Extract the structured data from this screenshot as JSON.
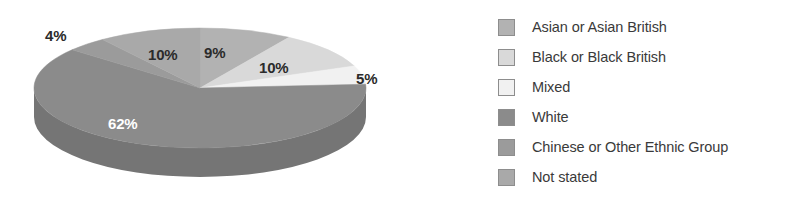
{
  "chart_data": {
    "type": "pie",
    "title": "",
    "subtitle": "",
    "xlabel": "",
    "ylabel": "",
    "three_d": true,
    "legend_position": "right",
    "grid": false,
    "categories": [
      "Asian or Asian British",
      "Black or Black British",
      "Mixed",
      "White",
      "Chinese or Other Ethnic Group",
      "Not stated"
    ],
    "values": [
      9,
      10,
      5,
      62,
      4,
      10
    ],
    "value_labels": [
      "9%",
      "10%",
      "5%",
      "62%",
      "4%",
      "10%"
    ],
    "colors": [
      "#b2b2b2",
      "#d9d9d9",
      "#f1f1f1",
      "#8b8b8b",
      "#9b9b9b",
      "#a9a9a9"
    ],
    "side_colors": [
      "#989898",
      "#bcbcbc",
      "#d2d2d2",
      "#757575",
      "#848484",
      "#909090"
    ],
    "slice_order_clockwise_from_top": [
      "Asian or Asian British",
      "Black or Black British",
      "Mixed",
      "White",
      "Chinese or Other Ethnic Group",
      "Not stated"
    ]
  },
  "labels": {
    "asian": "9%",
    "black": "10%",
    "mixed": "5%",
    "white": "62%",
    "chinese": "4%",
    "notstated": "10%"
  },
  "legend": {
    "items": [
      {
        "label": "Asian or Asian British",
        "color": "#b2b2b2"
      },
      {
        "label": "Black or Black British",
        "color": "#d9d9d9"
      },
      {
        "label": "Mixed",
        "color": "#f1f1f1"
      },
      {
        "label": "White",
        "color": "#8b8b8b"
      },
      {
        "label": "Chinese or Other Ethnic Group",
        "color": "#9b9b9b"
      },
      {
        "label": "Not stated",
        "color": "#a9a9a9"
      }
    ]
  }
}
